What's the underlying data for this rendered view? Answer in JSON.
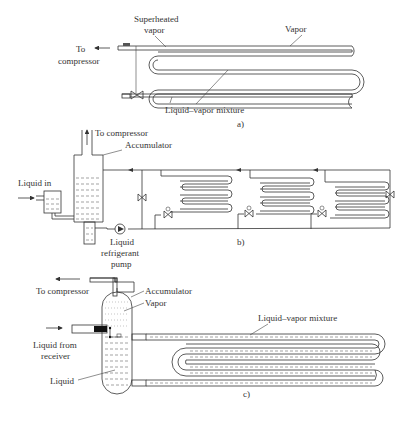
{
  "figure_a": {
    "caption": "a)",
    "labels": {
      "superheated_line1": "Superheated",
      "superheated_line2": "vapor",
      "vapor": "Vapor",
      "to_line1": "To",
      "to_line2": "compressor",
      "mixture": "Liquid–vapor mixture"
    }
  },
  "figure_b": {
    "caption": "b)",
    "labels": {
      "to_compressor": "To compressor",
      "accumulator": "Accumulator",
      "liquid_in": "Liquid in",
      "pump_line1": "Liquid",
      "pump_line2": "refrigerant",
      "pump_line3": "pump"
    }
  },
  "figure_c": {
    "caption": "c)",
    "labels": {
      "to_compressor": "To compressor",
      "accumulator": "Accumulator",
      "vapor": "Vapor",
      "mixture": "Liquid–vapor mixture",
      "from_line1": "Liquid from",
      "from_line2": "receiver",
      "liquid": "Liquid"
    }
  }
}
